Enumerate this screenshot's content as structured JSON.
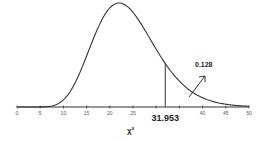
{
  "chart_data": {
    "type": "line",
    "title": "",
    "distribution": "chi-square density curve",
    "degrees_of_freedom_estimate": 24,
    "xlabel": "χ²",
    "ylabel": "",
    "xlim": [
      0,
      50
    ],
    "x_ticks": [
      0,
      5,
      10,
      15,
      20,
      25,
      30,
      35,
      40,
      45,
      50
    ],
    "x_tick_labels": [
      "0",
      "5",
      "10",
      "15",
      "20",
      "25",
      "",
      "",
      "40",
      "45",
      "50"
    ],
    "critical_value": 31.953,
    "critical_value_label": "31.953",
    "tail_probability": 0.128,
    "tail_probability_label": "0.128",
    "grid": false,
    "legend": null,
    "annotations": [
      {
        "text": "31.953",
        "position": "below axis at critical value"
      },
      {
        "text": "0.128",
        "position": "right tail, with arrow pointing into tail area"
      }
    ]
  },
  "colors": {
    "curve": "#333333",
    "axis": "#333333",
    "text": "#222222",
    "tick_text": "#555555"
  }
}
